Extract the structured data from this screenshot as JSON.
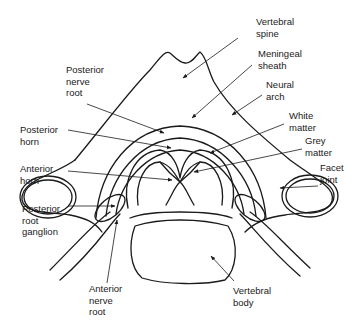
{
  "diagram": {
    "labels": {
      "vertebral_spine": "Vertebral\nspine",
      "meningeal_sheath": "Meningeal\nsheath",
      "neural_arch": "Neural\narch",
      "white_matter": "White\nmatter",
      "grey_matter": "Grey\nmatter",
      "facet_joint": "Facet\njoint",
      "posterior_nerve_root": "Posterior\nnerve\nroot",
      "posterior_horn": "Posterior\nhorn",
      "anterior_horn": "Anterior\nhorn",
      "posterior_root_ganglion": "Posterior\nroot\nganglion",
      "anterior_nerve_root": "Anterior\nnerve\nroot",
      "vertebral_body": "Vertebral\nbody"
    },
    "colors": {
      "line": "#1a1a1a",
      "background": "#ffffff"
    }
  }
}
